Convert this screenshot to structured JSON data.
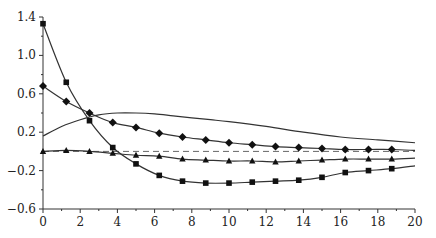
{
  "chart_data": {
    "type": "line",
    "title": "",
    "xlabel": "",
    "ylabel": "",
    "xlim": [
      0,
      20
    ],
    "ylim": [
      -0.6,
      1.4
    ],
    "grid": false,
    "legend": null,
    "x_ticks": [
      0,
      2,
      4,
      6,
      8,
      10,
      12,
      14,
      16,
      18,
      20
    ],
    "y_ticks": [
      -0.6,
      -0.2,
      0.2,
      0.6,
      1.0,
      1.4
    ],
    "x_tick_labels": [
      "0",
      "2",
      "4",
      "6",
      "8",
      "10",
      "12",
      "14",
      "16",
      "18",
      "20"
    ],
    "y_tick_labels": [
      "-0.6",
      "-0.2",
      "0.2",
      "0.6",
      "1.0",
      "1.4"
    ],
    "reference_line": {
      "y": 0,
      "style": "dashed"
    },
    "series": [
      {
        "name": "square-marker-series",
        "marker": "square",
        "x": [
          0,
          1.25,
          2.5,
          3.75,
          5,
          6.25,
          7.5,
          8.75,
          10,
          11.25,
          12.5,
          13.75,
          15,
          16.25,
          17.5,
          18.75,
          20
        ],
        "values": [
          1.33,
          0.72,
          0.32,
          0.04,
          -0.13,
          -0.25,
          -0.31,
          -0.33,
          -0.33,
          -0.32,
          -0.31,
          -0.3,
          -0.27,
          -0.22,
          -0.2,
          -0.18,
          -0.15
        ],
        "markers_at": [
          0,
          1.25,
          2.5,
          3.75,
          5,
          6.25,
          7.5,
          8.75,
          10,
          11.25,
          12.5,
          13.75,
          15,
          16.25,
          17.5,
          18.75
        ]
      },
      {
        "name": "diamond-marker-series",
        "marker": "diamond",
        "x": [
          0,
          1.25,
          2.5,
          3.75,
          5,
          6.25,
          7.5,
          8.75,
          10,
          11.25,
          12.5,
          13.75,
          15,
          16.25,
          17.5,
          18.75,
          20
        ],
        "values": [
          0.68,
          0.52,
          0.4,
          0.3,
          0.25,
          0.19,
          0.15,
          0.12,
          0.09,
          0.07,
          0.05,
          0.04,
          0.03,
          0.02,
          0.02,
          0.02,
          0.01
        ],
        "markers_at": [
          0,
          1.25,
          2.5,
          3.75,
          5,
          6.25,
          7.5,
          8.75,
          10,
          11.25,
          12.5,
          13.75,
          15,
          16.25,
          17.5,
          18.75
        ]
      },
      {
        "name": "triangle-marker-series",
        "marker": "triangle",
        "x": [
          0,
          1.25,
          2.5,
          3.75,
          5,
          6.25,
          7.5,
          8.75,
          10,
          11.25,
          12.5,
          13.75,
          15,
          16.25,
          17.5,
          18.75,
          20
        ],
        "values": [
          0.0,
          0.01,
          0.0,
          -0.02,
          -0.04,
          -0.05,
          -0.08,
          -0.09,
          -0.1,
          -0.1,
          -0.11,
          -0.1,
          -0.09,
          -0.08,
          -0.08,
          -0.08,
          -0.07
        ],
        "markers_at": [
          0,
          1.25,
          2.5,
          3.75,
          5,
          6.25,
          7.5,
          8.75,
          10,
          11.25,
          12.5,
          13.75,
          15,
          16.25,
          17.5,
          18.75
        ]
      },
      {
        "name": "smooth-curve-no-markers",
        "marker": "none",
        "x": [
          0,
          1,
          2,
          3,
          4,
          5,
          6,
          7,
          8,
          9,
          10,
          12,
          14,
          16,
          18,
          20
        ],
        "values": [
          0.16,
          0.26,
          0.33,
          0.38,
          0.4,
          0.4,
          0.39,
          0.37,
          0.35,
          0.33,
          0.31,
          0.26,
          0.2,
          0.15,
          0.12,
          0.09
        ]
      }
    ]
  }
}
